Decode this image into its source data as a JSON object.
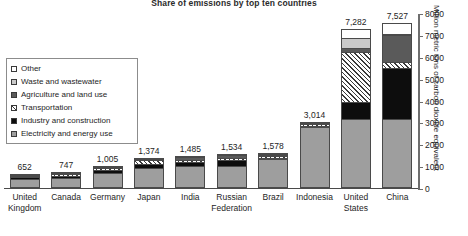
{
  "chart_data": {
    "type": "bar",
    "title": "Share of emissions by top ten countries",
    "xlabel": "",
    "ylabel": "Million metric tons of carbon dioxide equivalent",
    "ylim": [
      0,
      8000
    ],
    "yticks": [
      "0",
      "1000",
      "2000",
      "3000",
      "4000",
      "5000",
      "6000",
      "7000",
      "8000"
    ],
    "grid": false,
    "legend_position": "inside-left",
    "stacked": true,
    "categories": [
      "United Kingdom",
      "Canada",
      "Germany",
      "Japan",
      "India",
      "Russian Federation",
      "Brazil",
      "Indonesia",
      "United States",
      "China"
    ],
    "totals": [
      652,
      747,
      1005,
      1374,
      1485,
      1534,
      1578,
      3014,
      7282,
      7527
    ],
    "total_labels": [
      "652",
      "747",
      "1,005",
      "1,374",
      "1,485",
      "1,534",
      "1,578",
      "3,014",
      "7,282",
      "7,527"
    ],
    "series": [
      {
        "name": "Electricity and energy use",
        "swatch": "medium-gray",
        "values": [
          470,
          470,
          700,
          930,
          980,
          980,
          1330,
          2790,
          3100,
          3100
        ]
      },
      {
        "name": "Industry and construction",
        "swatch": "black",
        "values": [
          60,
          70,
          110,
          200,
          210,
          240,
          60,
          40,
          800,
          2350
        ]
      },
      {
        "name": "Transportation",
        "swatch": "diagonal-hatch",
        "values": [
          75,
          120,
          110,
          180,
          100,
          120,
          60,
          60,
          2250,
          280
        ]
      },
      {
        "name": "Agriculture and land use",
        "swatch": "dark-gray",
        "values": [
          20,
          45,
          30,
          20,
          140,
          110,
          80,
          60,
          190,
          1200
        ]
      },
      {
        "name": "Waste and wastewater",
        "swatch": "light-gray",
        "values": [
          17,
          22,
          25,
          24,
          35,
          44,
          28,
          44,
          480,
          80
        ]
      },
      {
        "name": "Other",
        "swatch": "white",
        "values": [
          10,
          20,
          30,
          20,
          20,
          40,
          20,
          20,
          462,
          517
        ]
      }
    ],
    "colors": {
      "medium-gray": "#9e9e9e",
      "black": "#0d0d0d",
      "diagonal-hatch": "#ffffff",
      "dark-gray": "#5a5a5a",
      "light-gray": "#c9c9c9",
      "white": "#ffffff",
      "outline": "#4a4a4a",
      "axis": "#6e6e6e"
    }
  },
  "legend": {
    "items": [
      {
        "label": "Other",
        "swatch": "white"
      },
      {
        "label": "Waste and wastewater",
        "swatch": "light-gray"
      },
      {
        "label": "Agriculture and land use",
        "swatch": "dark-gray"
      },
      {
        "label": "Transportation",
        "swatch": "diagonal-hatch"
      },
      {
        "label": "Industry and construction",
        "swatch": "black"
      },
      {
        "label": "Electricity and energy use",
        "swatch": "medium-gray"
      }
    ]
  }
}
